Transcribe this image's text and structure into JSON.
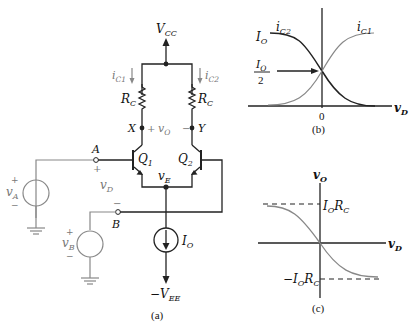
{
  "figure_a": {
    "caption": "(a)",
    "supply_top": "V",
    "supply_top_sub": "CC",
    "supply_bottom": "−V",
    "supply_bottom_sub": "EE",
    "resistor_left": "R",
    "resistor_left_sub": "C",
    "resistor_right": "R",
    "resistor_right_sub": "C",
    "current_left": "i",
    "current_left_sub": "C1",
    "current_right": "i",
    "current_right_sub": "C2",
    "node_x": "X",
    "node_y": "Y",
    "output_voltage": "v",
    "output_voltage_sub": "O",
    "plus": "+",
    "minus": "−",
    "transistor_1": "Q",
    "transistor_1_sub": "1",
    "transistor_2": "Q",
    "transistor_2_sub": "2",
    "emitter_node": "v",
    "emitter_node_sub": "E",
    "input_a": "A",
    "input_b": "B",
    "diff_voltage": "v",
    "diff_voltage_sub": "D",
    "source_a": "v",
    "source_a_sub": "A",
    "source_b": "v",
    "source_b_sub": "B",
    "tail_current": "I",
    "tail_current_sub": "O"
  },
  "figure_b": {
    "caption": "(b)",
    "curve_1": "i",
    "curve_1_sub": "C1",
    "curve_2": "i",
    "curve_2_sub": "C2",
    "level_top": "I",
    "level_top_sub": "O",
    "midpoint_num": "I",
    "midpoint_num_sub": "O",
    "midpoint_den": "2",
    "origin": "0",
    "x_axis": "v",
    "x_axis_sub": "D"
  },
  "figure_c": {
    "caption": "(c)",
    "y_axis": "v",
    "y_axis_sub": "O",
    "x_axis": "v",
    "x_axis_sub": "D",
    "upper_level": "I",
    "upper_level_sub": "O",
    "upper_level_tail": "R",
    "upper_level_tail_sub": "C",
    "lower_level": "−I",
    "lower_level_sub": "O",
    "lower_level_tail": "R",
    "lower_level_tail_sub": "C"
  }
}
